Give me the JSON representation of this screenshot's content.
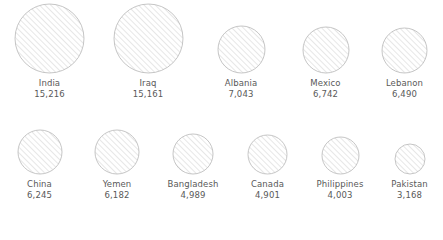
{
  "chart_data": {
    "type": "bubble",
    "title": "",
    "subtitle": "",
    "xlabel": "",
    "ylabel": "",
    "legend": "none",
    "grid": false,
    "axes": "none",
    "encoding": "circle area proportional to value",
    "categories": [
      "India",
      "Iraq",
      "Albania",
      "Mexico",
      "Lebanon",
      "China",
      "Yemen",
      "Bangladesh",
      "Canada",
      "Philippines",
      "Pakistan"
    ],
    "values": [
      15216,
      15161,
      7043,
      6742,
      6490,
      6245,
      6182,
      4989,
      4901,
      4003,
      3168
    ],
    "value_labels": [
      "15,216",
      "15,161",
      "7,043",
      "6,742",
      "6,490",
      "6,245",
      "6,182",
      "4,989",
      "4,901",
      "4,003",
      "3,168"
    ],
    "max_value": 15216,
    "min_value": 3168
  },
  "style": {
    "background": "#ffffff",
    "circle_stroke": "#b8b8b8",
    "hatch_color": "#cfcfcf",
    "text_color": "#595959"
  },
  "rows": [
    {
      "id": "row-1",
      "items": [
        {
          "name": "India",
          "value": 15216,
          "value_label": "15,216",
          "diameter": 69,
          "cell_width": 99
        },
        {
          "name": "Iraq",
          "value": 15161,
          "value_label": "15,161",
          "diameter": 69,
          "cell_width": 98
        },
        {
          "name": "Albania",
          "value": 7043,
          "value_label": "7,043",
          "diameter": 47,
          "cell_width": 88
        },
        {
          "name": "Mexico",
          "value": 6742,
          "value_label": "6,742",
          "diameter": 46,
          "cell_width": 81
        },
        {
          "name": "Lebanon",
          "value": 6490,
          "value_label": "6,490",
          "diameter": 45,
          "cell_width": 77
        }
      ]
    },
    {
      "id": "row-2",
      "items": [
        {
          "name": "China",
          "value": 6245,
          "value_label": "6,245",
          "diameter": 44,
          "cell_width": 79
        },
        {
          "name": "Yemen",
          "value": 6182,
          "value_label": "6,182",
          "diameter": 44,
          "cell_width": 76
        },
        {
          "name": "Bangladesh",
          "value": 4989,
          "value_label": "4,989",
          "diameter": 40,
          "cell_width": 76
        },
        {
          "name": "Canada",
          "value": 4901,
          "value_label": "4,901",
          "diameter": 39,
          "cell_width": 73
        },
        {
          "name": "Philippines",
          "value": 4003,
          "value_label": "4,003",
          "diameter": 37,
          "cell_width": 72
        },
        {
          "name": "Pakistan",
          "value": 3168,
          "value_label": "3,168",
          "diameter": 30,
          "cell_width": 67
        }
      ]
    }
  ]
}
